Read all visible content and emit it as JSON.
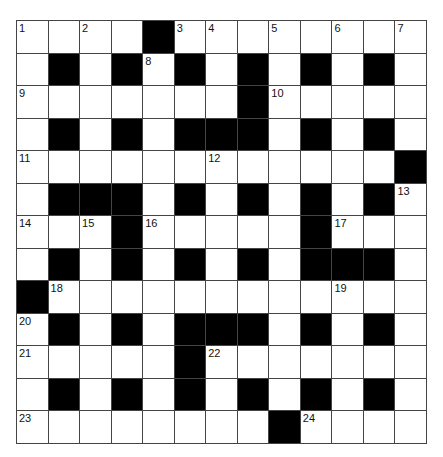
{
  "puzzle": {
    "rows": 13,
    "cols": 13,
    "grid": [
      "....#........",
      ".#.#.#.#.#.#.",
      ".......#.....",
      ".#.#.###.#.#.",
      "............#",
      ".###.#.#.#.#.",
      "...#.....#...",
      ".#.#.#.#.###.",
      "#............",
      ".#.#.###.#.#.",
      ".....#.......",
      ".#.#.#.#.#.#.",
      "........#...."
    ],
    "numbers": [
      {
        "r": 0,
        "c": 0,
        "n": "1"
      },
      {
        "r": 0,
        "c": 2,
        "n": "2"
      },
      {
        "r": 0,
        "c": 5,
        "n": "3"
      },
      {
        "r": 0,
        "c": 6,
        "n": "4"
      },
      {
        "r": 0,
        "c": 8,
        "n": "5"
      },
      {
        "r": 0,
        "c": 10,
        "n": "6"
      },
      {
        "r": 0,
        "c": 12,
        "n": "7"
      },
      {
        "r": 1,
        "c": 4,
        "n": "8"
      },
      {
        "r": 2,
        "c": 0,
        "n": "9"
      },
      {
        "r": 2,
        "c": 8,
        "n": "10"
      },
      {
        "r": 4,
        "c": 0,
        "n": "11"
      },
      {
        "r": 4,
        "c": 6,
        "n": "12"
      },
      {
        "r": 5,
        "c": 12,
        "n": "13"
      },
      {
        "r": 6,
        "c": 0,
        "n": "14"
      },
      {
        "r": 6,
        "c": 2,
        "n": "15"
      },
      {
        "r": 6,
        "c": 4,
        "n": "16"
      },
      {
        "r": 6,
        "c": 10,
        "n": "17"
      },
      {
        "r": 8,
        "c": 1,
        "n": "18"
      },
      {
        "r": 8,
        "c": 10,
        "n": "19"
      },
      {
        "r": 9,
        "c": 0,
        "n": "20"
      },
      {
        "r": 10,
        "c": 0,
        "n": "21"
      },
      {
        "r": 10,
        "c": 6,
        "n": "22"
      },
      {
        "r": 12,
        "c": 0,
        "n": "23"
      },
      {
        "r": 12,
        "c": 9,
        "n": "24"
      }
    ],
    "colors": {
      "block": "#000000",
      "cell": "#ffffff",
      "line": "#444444"
    }
  }
}
